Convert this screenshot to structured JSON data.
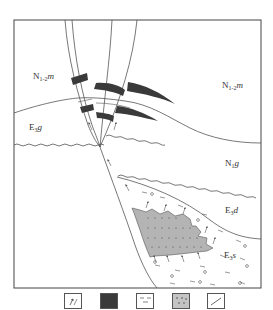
{
  "figure": {
    "type": "geological cross-section",
    "labels": {
      "n12m_left": {
        "base": "N",
        "sub": "1-2",
        "suffix": "m"
      },
      "n12m_right": {
        "base": "N",
        "sub": "1-2",
        "suffix": "m"
      },
      "e3g": {
        "base": "E",
        "sub": "3",
        "suffix": "g"
      },
      "n1g": {
        "base": "N",
        "sub": "1",
        "suffix": "g"
      },
      "e3d": {
        "base": "E",
        "sub": "3",
        "suffix": "d"
      },
      "e3s": {
        "base": "E",
        "sub": "3",
        "suffix": "s"
      }
    },
    "colors": {
      "line": "#555555",
      "dark_band": "#3a3a3a",
      "sand_fill": "#b4b4b4",
      "dots": "#444444",
      "frame": "#444444"
    }
  },
  "legend": {
    "items": [
      {
        "icon": "migration-arrow-icon",
        "description": "oil migration direction"
      },
      {
        "icon": "dark-layer-icon",
        "description": "dark mudstone / coal layer"
      },
      {
        "icon": "mudstone-dash-icon",
        "description": "mudstone"
      },
      {
        "icon": "sandstone-dot-icon",
        "description": "sandstone"
      },
      {
        "icon": "fault-line-icon",
        "description": "fault"
      }
    ]
  }
}
